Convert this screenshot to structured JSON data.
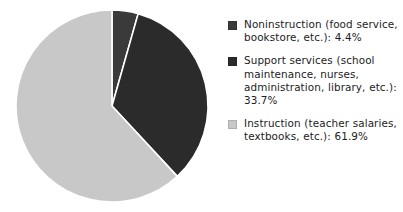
{
  "chart_data": {
    "type": "pie",
    "title": "",
    "subtitle": "",
    "xlabel": "",
    "ylabel": "",
    "grid": false,
    "legend_position": "right",
    "units": "percent",
    "total": "100.0%",
    "start_angle_deg": 0,
    "direction": "clockwise",
    "categories": [
      "Noninstruction (food service, bookstore, etc.)",
      "Support services (school maintenance, nurses, administration, library, etc.)",
      "Instruction (teacher salaries, textbooks, etc.)"
    ],
    "values": [
      4.4,
      33.7,
      61.9
    ],
    "slices": [
      {
        "label": "Noninstruction (food service, bookstore, etc.):",
        "value": 4.4,
        "value_label": "4.4%",
        "color": "#3a3a3a",
        "angle_deg": 15.84,
        "start_deg": 0,
        "end_deg": 15.84
      },
      {
        "label": "Support services (school maintenance, nurses, administration, library, etc.):",
        "value": 33.7,
        "value_label": "33.7%",
        "color": "#2b2b2b",
        "angle_deg": 121.32,
        "start_deg": 15.84,
        "end_deg": 137.16
      },
      {
        "label": "Instruction (teacher salaries, textbooks, etc.):",
        "value": 61.9,
        "value_label": "61.9%",
        "color": "#c8c8c8",
        "angle_deg": 222.84,
        "start_deg": 137.16,
        "end_deg": 360
      }
    ]
  },
  "legend": {
    "entries": [
      {
        "label": "Noninstruction (food service, bookstore, etc.): 4.4%",
        "swatch_color": "#3a3a3a"
      },
      {
        "label": "Support services (school maintenance, nurses, administration, library, etc.): 33.7%",
        "swatch_color": "#2b2b2b"
      },
      {
        "label": "Instruction (teacher salaries, textbooks, etc.): 61.9%",
        "swatch_color": "#c8c8c8"
      }
    ]
  },
  "style": {
    "background": "#ffffff",
    "separator_color": "#ffffff",
    "text_color": "#1c1c1c"
  }
}
